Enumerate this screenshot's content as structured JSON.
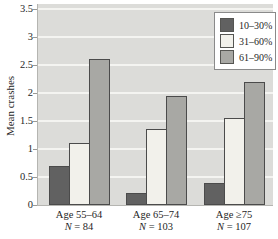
{
  "chart_data": {
    "type": "bar",
    "title": "",
    "ylabel": "Mean crashes",
    "xlabel": "",
    "ylim": [
      0,
      3.5
    ],
    "ytick_step": 0.5,
    "yticks": [
      0,
      0.5,
      1,
      1.5,
      2,
      2.5,
      3,
      3.5
    ],
    "grid": true,
    "legend_position": "top-right",
    "categories": [
      "Age 55–64",
      "Age 65–74",
      "Age ≥75"
    ],
    "category_sublabels": [
      "N = 84",
      "N = 103",
      "N = 107"
    ],
    "series": [
      {
        "name": "10–30%",
        "color": "#616161",
        "values": [
          0.7,
          0.22,
          0.4
        ]
      },
      {
        "name": "31–60%",
        "color": "#f2f1eb",
        "values": [
          1.1,
          1.35,
          1.55
        ]
      },
      {
        "name": "61–90%",
        "color": "#a8a8a4",
        "values": [
          2.6,
          1.95,
          2.2
        ]
      }
    ],
    "colors": {
      "plot_bg": "#dcdcd9",
      "gridline": "#f4f4f1",
      "bar_border": "#4b4b4b",
      "axis": "#b5b5b1",
      "legend_bg": "#ffffff",
      "legend_border": "#8a8a8a",
      "text": "#1f1f1f"
    }
  }
}
